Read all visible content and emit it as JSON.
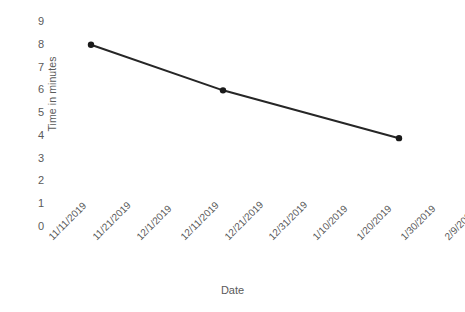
{
  "chart_data": {
    "type": "line",
    "title": "",
    "xlabel": "Date",
    "ylabel": "Time in minutes",
    "grid": false,
    "legend": "none",
    "background_color": "#ffffff",
    "line_color": "#262626",
    "marker_color": "#1a1a1a",
    "tick_label_color": "#5a5a5a",
    "ylim": [
      0,
      9
    ],
    "y_ticks": [
      0,
      1,
      2,
      3,
      4,
      5,
      6,
      7,
      8,
      9
    ],
    "y_tick_labels": [
      "0",
      "1",
      "2",
      "3",
      "4",
      "5",
      "6",
      "7",
      "8",
      "9"
    ],
    "x_tick_labels": [
      "11/11/2019",
      "11/21/2019",
      "12/1/2019",
      "12/11/2019",
      "12/21/2019",
      "12/31/2019",
      "1/10/2019",
      "1/20/2019",
      "1/30/2019",
      "2/9/2020"
    ],
    "x_tick_index": [
      0,
      1,
      2,
      3,
      4,
      5,
      6,
      7,
      8,
      9
    ],
    "series": [
      {
        "name": "Time in minutes",
        "points": [
          {
            "x_label": "11/21/2019",
            "x_index": 1,
            "y": 8.0
          },
          {
            "x_label": "12/21/2019",
            "x_index": 4,
            "y": 6.0
          },
          {
            "x_label": "1/30/2019",
            "x_index": 8,
            "y": 3.9
          }
        ]
      }
    ]
  }
}
